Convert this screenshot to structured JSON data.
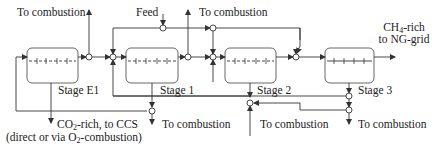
{
  "diagram": {
    "stages": [
      {
        "id": "stage-e1",
        "label": "Stage E1"
      },
      {
        "id": "stage-1",
        "label": "Stage 1"
      },
      {
        "id": "stage-2",
        "label": "Stage 2"
      },
      {
        "id": "stage-3",
        "label": "Stage 3"
      }
    ],
    "labels": {
      "feed": "Feed",
      "to_combustion_top_left": "To combustion",
      "to_combustion_top_mid": "To combustion",
      "product_line1_prefix": "CH",
      "product_line1_sub": "4",
      "product_line1_suffix": "-rich",
      "product_line2": "to NG-grid",
      "co2_prefix": "CO",
      "co2_sub": "2",
      "co2_suffix": "-rich, to CCS",
      "co2_line2_prefix": "(direct or via O",
      "co2_line2_sub": "2",
      "co2_line2_suffix": "-combustion)",
      "to_combustion_bottom_1": "To combustion",
      "to_combustion_bottom_2": "To combustion",
      "to_combustion_bottom_3": "To combustion"
    },
    "colors": {
      "line": "#333333",
      "box_border": "#555555",
      "background": "#ffffff"
    }
  }
}
